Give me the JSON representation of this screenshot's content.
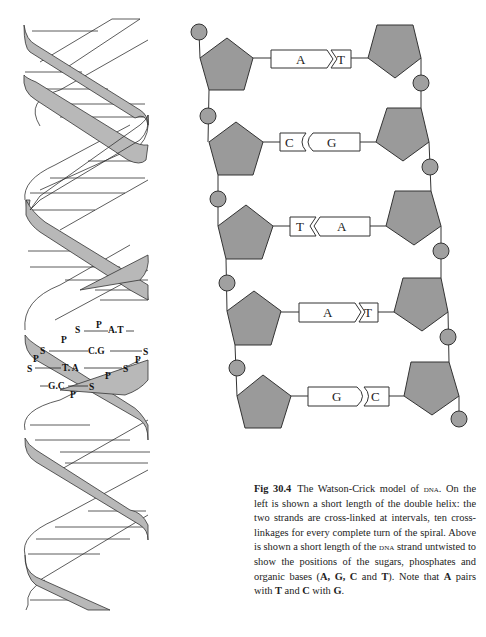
{
  "figure": {
    "number": "Fig 30.4",
    "title": "The Watson-Crick model of DNA.",
    "caption_parts": [
      {
        "text": "The Watson-Crick model of ",
        "style": "plain"
      },
      {
        "text": "dna",
        "style": "smallcaps"
      },
      {
        "text": ". On the left is shown a short length of the double helix: the two strands are cross-linked at intervals, ten cross-linkages for every complete turn of the spiral. Above is shown a short length of the ",
        "style": "plain"
      },
      {
        "text": "dna",
        "style": "smallcaps"
      },
      {
        "text": " strand untwisted to show the positions of the sugars, phosphates and organic bases (",
        "style": "plain"
      },
      {
        "text": "A, G, C",
        "style": "bold"
      },
      {
        "text": " and ",
        "style": "plain"
      },
      {
        "text": "T",
        "style": "bold"
      },
      {
        "text": "). Note that ",
        "style": "plain"
      },
      {
        "text": "A",
        "style": "bold"
      },
      {
        "text": " pairs with ",
        "style": "plain"
      },
      {
        "text": "T",
        "style": "bold"
      },
      {
        "text": " and ",
        "style": "plain"
      },
      {
        "text": "C",
        "style": "bold"
      },
      {
        "text": " with ",
        "style": "plain"
      },
      {
        "text": "G",
        "style": "bold"
      },
      {
        "text": ".",
        "style": "plain"
      }
    ]
  },
  "helix": {
    "labels": {
      "row1": {
        "s": "S",
        "p": "P",
        "pair": "A.T"
      },
      "row2": {
        "p": "P",
        "s_left": "S",
        "pair": "C.G",
        "s_right": "S"
      },
      "row3": {
        "p_left": "P",
        "s_left": "S",
        "pair": "T. A",
        "s_right": "S",
        "p_right": "P"
      },
      "row4": {
        "pair": "G.C",
        "s": "S",
        "p_mid": "P",
        "p_bottom": "P"
      }
    }
  },
  "ladder": {
    "rows": [
      {
        "left_base": "A",
        "right_base": "T",
        "joint": "chevron-right"
      },
      {
        "left_base": "C",
        "right_base": "G",
        "joint": "curve-left"
      },
      {
        "left_base": "T",
        "right_base": "A",
        "joint": "chevron-left"
      },
      {
        "left_base": "A",
        "right_base": "T",
        "joint": "chevron-right"
      },
      {
        "left_base": "G",
        "right_base": "C",
        "joint": "curve-right"
      }
    ],
    "legend": {
      "sugar": "pentagon",
      "phosphate": "circle",
      "base": "rectangle"
    }
  },
  "colors": {
    "sugar_fill": "#9a9a9a",
    "phosphate_fill": "#a0a0a0",
    "ribbon_fill": "#b5b5b5",
    "line": "#3a3a3a",
    "text": "#222222"
  }
}
